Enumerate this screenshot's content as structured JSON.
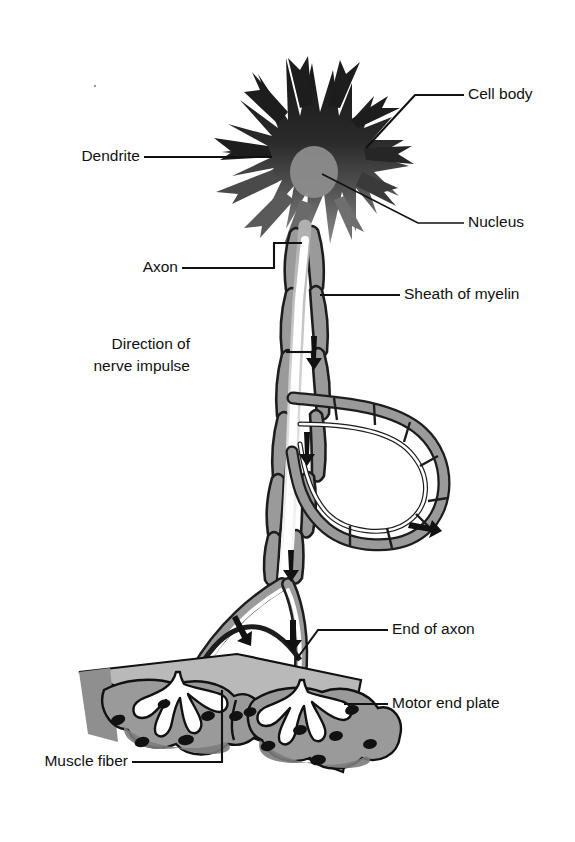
{
  "figure": {
    "background_color": "#ffffff",
    "ink_color": "#111111",
    "width": 575,
    "height": 842
  },
  "palette": {
    "cell_body_dark": "#1d1d1d",
    "cell_body_mid": "#4a4a4a",
    "nucleus_grey": "#8c8c8c",
    "myelin_grey": "#9a9a9a",
    "myelin_dark_edge": "#1d1d1d",
    "axon_white": "#ffffff",
    "muscle_light_grey": "#b9b9b9",
    "muscle_mid_grey": "#9a9a9a",
    "muscle_dark_grey": "#7c7c7c",
    "muscle_nucleus": "#111111",
    "outline": "#111111"
  },
  "labels": {
    "cell_body": "Cell body",
    "dendrite": "Dendrite",
    "nucleus": "Nucleus",
    "axon": "Axon",
    "sheath_of_myelin": "Sheath of myelin",
    "direction_line1": "Direction of",
    "direction_line2": "nerve impulse",
    "end_of_axon": "End of axon",
    "motor_end_plate": "Motor end plate",
    "muscle_fiber": "Muscle fiber"
  },
  "parts": [
    {
      "id": "cell-body",
      "label": "Cell body",
      "description": "Dark star-shaped soma with many pointed dendritic processes",
      "label_side": "right",
      "label_x": 468,
      "label_y": 95
    },
    {
      "id": "dendrite",
      "label": "Dendrite",
      "description": "Pointed branching process radiating from the cell body",
      "label_side": "left",
      "label_x": 148,
      "label_y": 157
    },
    {
      "id": "nucleus",
      "label": "Nucleus",
      "description": "Grey oval body inside the soma",
      "label_side": "right",
      "label_x": 468,
      "label_y": 223
    },
    {
      "id": "axon",
      "label": "Axon",
      "description": "Long white fibre leaving the cell body",
      "label_side": "left",
      "label_x": 178,
      "label_y": 268
    },
    {
      "id": "sheath-of-myelin",
      "label": "Sheath of myelin",
      "description": "Grey segmented covering along the axon",
      "label_side": "right",
      "label_x": 404,
      "label_y": 295
    },
    {
      "id": "direction-of-nerve-impulse",
      "label": "Direction of nerve impulse",
      "description": "Arrows along the axon pointing away from the cell body",
      "label_side": "left",
      "label_x": 190,
      "label_y": 352
    },
    {
      "id": "end-of-axon",
      "label": "End of axon",
      "description": "Terminal branches of the axon meeting the muscle",
      "label_side": "right",
      "label_x": 392,
      "label_y": 630
    },
    {
      "id": "motor-end-plate",
      "label": "Motor end plate",
      "description": "Lobed grey plate where the axon terminal meets the fibre",
      "label_side": "right",
      "label_x": 392,
      "label_y": 704
    },
    {
      "id": "muscle-fiber",
      "label": "Muscle fiber",
      "description": "Tilted slab of muscle tissue at the bottom of the figure",
      "label_side": "left",
      "label_x": 128,
      "label_y": 762
    }
  ],
  "impulse_arrows": [
    {
      "at": "upper axon",
      "direction": "down"
    },
    {
      "at": "mid axon",
      "direction": "down"
    },
    {
      "at": "below loop",
      "direction": "down"
    },
    {
      "at": "loop right",
      "direction": "right"
    },
    {
      "at": "left branch",
      "direction": "down"
    },
    {
      "at": "right branch",
      "direction": "down"
    }
  ]
}
